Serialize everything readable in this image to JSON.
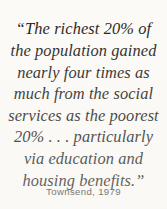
{
  "quote": {
    "lines": [
      "“The richest 20% of",
      "the population gained",
      "nearly four times as",
      "much from the social",
      "services as the poorest",
      "20% . . . particularly",
      "via education and",
      "housing benefits.”"
    ],
    "full_text": "“The richest 20% of the population gained nearly four times as much from the social services as the poorest 20% . . . particularly via education and housing benefits.”"
  },
  "attribution": {
    "text": "Townsend, 1979",
    "author": "Townsend",
    "year": "1979"
  },
  "colors": {
    "background": "#fbfaf7",
    "quote_text": "#1d1b1a",
    "attribution_text": "#3a3836"
  }
}
